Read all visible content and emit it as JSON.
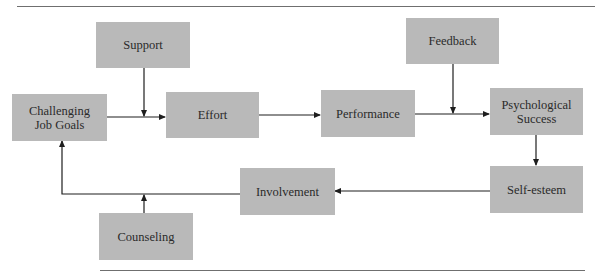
{
  "diagram": {
    "type": "flowchart",
    "nodes": {
      "support": "Support",
      "feedback": "Feedback",
      "challenging_job_goals": "Challenging Job Goals",
      "effort": "Effort",
      "performance": "Performance",
      "psychological_success": "Psychological Success",
      "self_esteem": "Self-esteem",
      "involvement": "Involvement",
      "counseling": "Counseling"
    },
    "edges": [
      {
        "from": "Challenging Job Goals",
        "to": "Effort"
      },
      {
        "from": "Support",
        "to": "Challenging Job Goals → Effort link"
      },
      {
        "from": "Effort",
        "to": "Performance"
      },
      {
        "from": "Performance",
        "to": "Psychological Success"
      },
      {
        "from": "Feedback",
        "to": "Performance → Psychological Success link"
      },
      {
        "from": "Psychological Success",
        "to": "Self-esteem"
      },
      {
        "from": "Self-esteem",
        "to": "Involvement"
      },
      {
        "from": "Involvement",
        "to": "Challenging Job Goals"
      },
      {
        "from": "Counseling",
        "to": "Involvement → Challenging Job Goals link"
      }
    ],
    "colors": {
      "box_fill": "#b9b9b9",
      "text": "#2a2a2a",
      "line": "#1e1e1e",
      "rule": "#6f6f6f"
    }
  }
}
